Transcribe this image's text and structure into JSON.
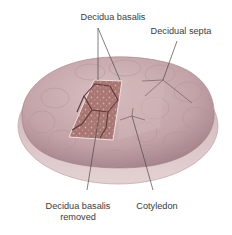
{
  "figure": {
    "labels": {
      "decidua_basalis": "Decidua basalis",
      "decidual_septa": "Decidual septa",
      "decidua_basalis_removed_line1": "Decidua basalis",
      "decidua_basalis_removed_line2": "removed",
      "cotyledon": "Cotyledon"
    },
    "colors": {
      "placenta_surface": "#c7a8ac",
      "placenta_shadow": "#9c7c82",
      "rim": "#d9c2c4",
      "exposed_tissue": "#a5726f",
      "exposed_dark": "#6f4541",
      "label_text": "#3a3a3a",
      "leader_line": "#4a4a4a"
    }
  }
}
